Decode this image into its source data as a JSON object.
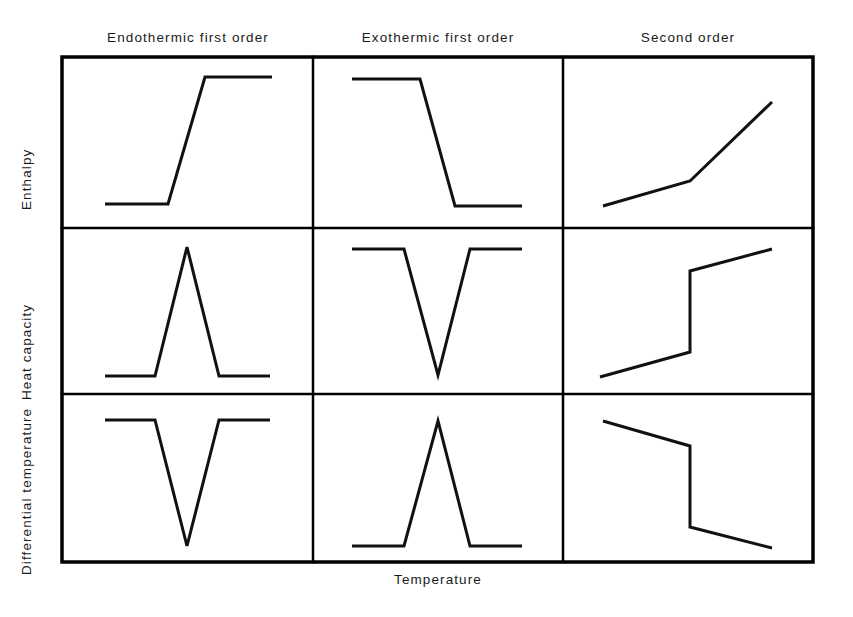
{
  "figure": {
    "x_axis_label": "Temperature",
    "column_headers": [
      {
        "label": "Endothermic first order",
        "center_x": 188,
        "y": 30
      },
      {
        "label": "Exothermic first order",
        "center_x": 438,
        "y": 30
      },
      {
        "label": "Second order",
        "center_x": 688,
        "y": 30
      }
    ],
    "row_labels": [
      {
        "label": "Enthalpy",
        "x": 26,
        "bottom_y": 195
      },
      {
        "label": "Heat capacity",
        "x": 26,
        "bottom_y": 385
      },
      {
        "label": "Differential temperature",
        "x": 26,
        "bottom_y": 560
      }
    ],
    "grid": {
      "left": 62,
      "top": 57,
      "right": 813,
      "bottom": 562,
      "v_dividers": [
        313,
        563
      ],
      "h_dividers": [
        228,
        394
      ],
      "border_color": "#000000",
      "border_width": 3.5,
      "inner_line_width": 2.5
    },
    "curve_color": "#111111",
    "curve_width": 3
  },
  "chart_data": {
    "type": "line",
    "xlabel": "Temperature",
    "ylabel": "",
    "grid": false,
    "legend": "none",
    "columns": [
      "Endothermic first order",
      "Exothermic first order",
      "Second order"
    ],
    "rows": [
      "Enthalpy",
      "Heat capacity",
      "Differential temperature"
    ],
    "panels": [
      {
        "row": "Enthalpy",
        "column": "Endothermic first order",
        "shape": "step-up",
        "description": "Flat low baseline, sharp rising ramp, flat high plateau",
        "points": [
          [
            105,
            204
          ],
          [
            168,
            204
          ],
          [
            205,
            77
          ],
          [
            272,
            77
          ]
        ]
      },
      {
        "row": "Enthalpy",
        "column": "Exothermic first order",
        "shape": "step-down",
        "description": "Flat high baseline, sharp falling ramp, flat low plateau",
        "points": [
          [
            352,
            79
          ],
          [
            420,
            79
          ],
          [
            455,
            206
          ],
          [
            522,
            206
          ]
        ]
      },
      {
        "row": "Enthalpy",
        "column": "Second order",
        "shape": "slope-change-up",
        "description": "Gentle rising line, knee, steeper rising line (no discontinuity)",
        "points": [
          [
            603,
            206
          ],
          [
            690,
            181
          ],
          [
            772,
            102
          ]
        ]
      },
      {
        "row": "Heat capacity",
        "column": "Endothermic first order",
        "shape": "peak-up",
        "description": "Low baseline with a tall narrow upward spike",
        "points": [
          [
            105,
            376
          ],
          [
            155,
            376
          ],
          [
            187,
            247
          ],
          [
            219,
            376
          ],
          [
            270,
            376
          ]
        ]
      },
      {
        "row": "Heat capacity",
        "column": "Exothermic first order",
        "shape": "peak-down",
        "description": "High baseline with a deep narrow downward spike",
        "points": [
          [
            352,
            249
          ],
          [
            404,
            249
          ],
          [
            438,
            375
          ],
          [
            470,
            249
          ],
          [
            522,
            249
          ]
        ]
      },
      {
        "row": "Heat capacity",
        "column": "Second order",
        "shape": "jump-up",
        "description": "Gentle rise, vertical upward jump discontinuity, gentle rise",
        "points": [
          [
            600,
            377
          ],
          [
            690,
            352
          ],
          [
            690,
            271
          ],
          [
            772,
            249
          ]
        ]
      },
      {
        "row": "Differential temperature",
        "column": "Endothermic first order",
        "shape": "peak-down",
        "description": "High baseline with a deep narrow downward spike",
        "points": [
          [
            105,
            420
          ],
          [
            155,
            420
          ],
          [
            187,
            546
          ],
          [
            219,
            420
          ],
          [
            270,
            420
          ]
        ]
      },
      {
        "row": "Differential temperature",
        "column": "Exothermic first order",
        "shape": "peak-up",
        "description": "Low baseline with a tall narrow upward spike",
        "points": [
          [
            352,
            546
          ],
          [
            404,
            546
          ],
          [
            438,
            421
          ],
          [
            470,
            546
          ],
          [
            522,
            546
          ]
        ]
      },
      {
        "row": "Differential temperature",
        "column": "Second order",
        "shape": "jump-down",
        "description": "Gentle decline, vertical downward jump discontinuity, gentle decline",
        "points": [
          [
            603,
            421
          ],
          [
            690,
            446
          ],
          [
            690,
            527
          ],
          [
            772,
            548
          ]
        ]
      }
    ]
  }
}
